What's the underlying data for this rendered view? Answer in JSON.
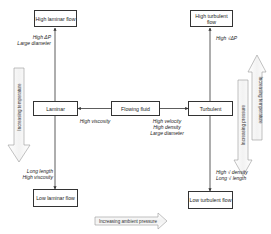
{
  "diagram": {
    "nodes": {
      "high_laminar": "High laminar flow",
      "high_turbulent": "High turbulent flow",
      "laminar": "Laminar",
      "flowing_fluid": "Flowing fluid",
      "turbulent": "Turbulent",
      "low_laminar": "Low laminar flow",
      "low_turbulent": "Low turbulent flow"
    },
    "edge_labels": {
      "laminar_up_1": "High ΔP",
      "laminar_up_2": "Large diameter",
      "turbulent_up": "High √ΔP",
      "to_laminar": "High viscosity",
      "to_turbulent_1": "High velocity",
      "to_turbulent_2": "High density",
      "to_turbulent_3": "Large diameter",
      "laminar_down_1": "Long length",
      "laminar_down_2": "High viscosity",
      "turbulent_down_1": "High √ density",
      "turbulent_down_2": "Long √ length"
    },
    "trend_arrows": {
      "left_temperature": "Increasing temperature",
      "right_temperature": "Increasing temperature",
      "right_pressure": "Increasing pressure",
      "bottom_ambient_pressure": "Increasing ambient pressure"
    },
    "colors": {
      "line": "#333333",
      "block_arrow_stroke": "#999999",
      "background": "#ffffff"
    }
  }
}
